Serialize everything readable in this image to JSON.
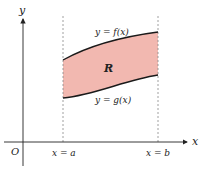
{
  "diagram": {
    "axes": {
      "x_label": "x",
      "y_label": "y",
      "origin_label": "O"
    },
    "bounds": {
      "left_label": "x = a",
      "right_label": "x = b"
    },
    "curves": {
      "top_label": "y = f(x)",
      "bottom_label": "y = g(x)"
    },
    "region": {
      "label": "R",
      "fill_color": "#f2b8b0"
    },
    "colors": {
      "axis": "#222222",
      "curve": "#1a1a1a",
      "dashed": "#888888"
    }
  }
}
